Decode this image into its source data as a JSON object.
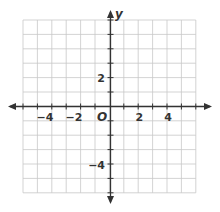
{
  "diagram": {
    "type": "coordinate-plane",
    "x_axis_label": "x",
    "y_axis_label": "y",
    "origin_label": "O",
    "x_range": [
      -6,
      6
    ],
    "y_range": [
      -6,
      6
    ],
    "grid_step": 1,
    "x_tick_labels": [
      "−4",
      "−2",
      "2",
      "4"
    ],
    "y_tick_labels": [
      "2",
      "−4"
    ],
    "colors": {
      "grid": "#c8c8c8",
      "axis": "#333333",
      "background": "#ffffff"
    }
  }
}
